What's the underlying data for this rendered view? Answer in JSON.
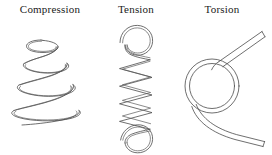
{
  "figure": {
    "name": "spring-types-diagram",
    "background_color": "#ffffff",
    "line_color": "#4a4a4a",
    "panels": [
      {
        "id": "compression",
        "label": "Compression",
        "icon_name": "conical-compression-spring-icon",
        "description": "Conical helical spring, narrow at top and widening toward the bottom"
      },
      {
        "id": "tension",
        "label": "Tension",
        "icon_name": "extension-spring-with-hooks-icon",
        "description": "Cylindrical helical extension spring with a closed hook loop at each end"
      },
      {
        "id": "torsion",
        "label": "Torsion",
        "icon_name": "torsion-spring-icon",
        "description": "Single circular coil with two straight legs extending to the right"
      }
    ]
  }
}
